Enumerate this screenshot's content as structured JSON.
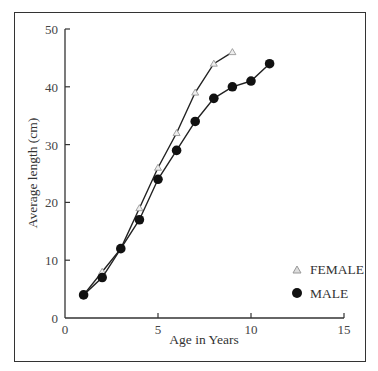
{
  "chart_data": {
    "type": "line",
    "title": "",
    "xlabel": "Age in Years",
    "ylabel": "Average length (cm)",
    "xlim": [
      0,
      15
    ],
    "ylim": [
      0,
      50
    ],
    "xticks": [
      0,
      5,
      10,
      15
    ],
    "yticks": [
      0,
      10,
      20,
      30,
      40,
      50
    ],
    "grid": false,
    "legend_position": "lower right",
    "series": [
      {
        "name": "FEMALE",
        "marker": "triangle",
        "color": "#999999",
        "x": [
          1,
          2,
          3,
          4,
          5,
          6,
          7,
          8,
          9
        ],
        "values": [
          4,
          8,
          12,
          19,
          26,
          32,
          39,
          44,
          46
        ]
      },
      {
        "name": "MALE",
        "marker": "filled-circle",
        "color": "#111111",
        "x": [
          1,
          2,
          3,
          4,
          5,
          6,
          7,
          8,
          9,
          10,
          11
        ],
        "values": [
          4,
          7,
          12,
          17,
          24,
          29,
          34,
          38,
          40,
          41,
          44
        ]
      }
    ]
  },
  "axes": {
    "x_title": "Age in Years",
    "y_title": "Average length (cm)",
    "x_tick_labels": [
      "0",
      "5",
      "10",
      "15"
    ],
    "y_tick_labels": [
      "0",
      "10",
      "20",
      "30",
      "40",
      "50"
    ]
  },
  "legend": {
    "female_label": "FEMALE",
    "male_label": "MALE"
  }
}
